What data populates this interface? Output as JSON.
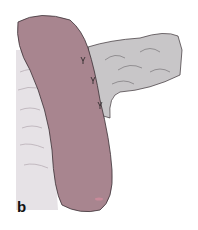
{
  "figure": {
    "panel_label": "b",
    "colors": {
      "stomach": "#a8858f",
      "bowel": "#c8c6c8",
      "tissue": "#e6e2e6",
      "outline": "#3a3035"
    },
    "sutures": 3
  }
}
